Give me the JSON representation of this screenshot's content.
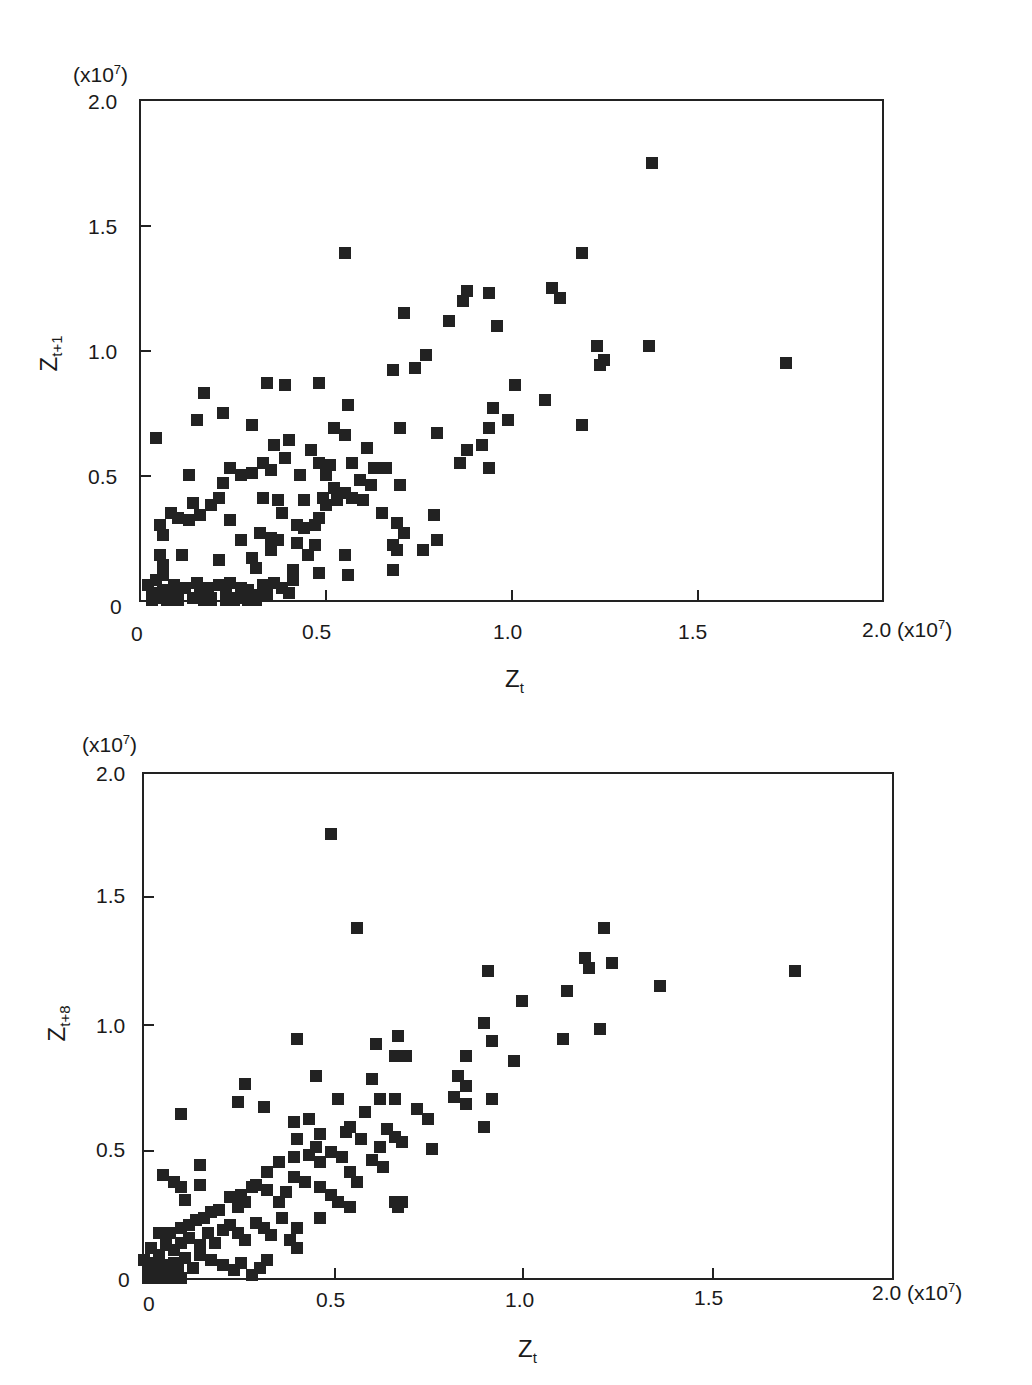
{
  "chart_data": [
    {
      "type": "scatter",
      "title": "",
      "xlabel": "Z_t",
      "ylabel": "Z_t+1",
      "x_unit": "(x10^7)",
      "y_unit": "(x10^7)",
      "xlim": [
        0,
        2.0
      ],
      "ylim": [
        0,
        2.0
      ],
      "xticks": [
        "0",
        "0.5",
        "1.0",
        "1.5",
        "2.0"
      ],
      "yticks": [
        "0",
        "0.5",
        "1.0",
        "1.5",
        "2.0"
      ],
      "grid": false,
      "points": [
        [
          1.38,
          1.75
        ],
        [
          0.55,
          1.39
        ],
        [
          1.19,
          1.39
        ],
        [
          0.88,
          1.24
        ],
        [
          0.94,
          1.23
        ],
        [
          1.11,
          1.25
        ],
        [
          0.87,
          1.2
        ],
        [
          1.13,
          1.21
        ],
        [
          0.71,
          1.15
        ],
        [
          0.83,
          1.12
        ],
        [
          0.96,
          1.1
        ],
        [
          1.23,
          1.02
        ],
        [
          1.37,
          1.02
        ],
        [
          1.74,
          0.95
        ],
        [
          1.24,
          0.94
        ],
        [
          1.25,
          0.96
        ],
        [
          0.68,
          0.92
        ],
        [
          0.74,
          0.93
        ],
        [
          0.77,
          0.98
        ],
        [
          1.01,
          0.86
        ],
        [
          0.17,
          0.83
        ],
        [
          0.34,
          0.87
        ],
        [
          0.39,
          0.86
        ],
        [
          0.48,
          0.87
        ],
        [
          0.56,
          0.78
        ],
        [
          0.22,
          0.75
        ],
        [
          0.15,
          0.72
        ],
        [
          1.09,
          0.8
        ],
        [
          0.95,
          0.77
        ],
        [
          0.99,
          0.72
        ],
        [
          1.19,
          0.7
        ],
        [
          0.04,
          0.65
        ],
        [
          0.3,
          0.7
        ],
        [
          0.7,
          0.69
        ],
        [
          0.8,
          0.67
        ],
        [
          0.52,
          0.69
        ],
        [
          0.55,
          0.66
        ],
        [
          0.92,
          0.62
        ],
        [
          0.94,
          0.69
        ],
        [
          0.88,
          0.6
        ],
        [
          0.86,
          0.55
        ],
        [
          0.94,
          0.53
        ],
        [
          0.36,
          0.62
        ],
        [
          0.4,
          0.64
        ],
        [
          0.46,
          0.6
        ],
        [
          0.33,
          0.55
        ],
        [
          0.35,
          0.52
        ],
        [
          0.39,
          0.57
        ],
        [
          0.48,
          0.55
        ],
        [
          0.51,
          0.54
        ],
        [
          0.57,
          0.55
        ],
        [
          0.61,
          0.61
        ],
        [
          0.63,
          0.53
        ],
        [
          0.66,
          0.53
        ],
        [
          0.24,
          0.53
        ],
        [
          0.27,
          0.5
        ],
        [
          0.3,
          0.51
        ],
        [
          0.13,
          0.5
        ],
        [
          0.43,
          0.5
        ],
        [
          0.5,
          0.5
        ],
        [
          0.55,
          0.43
        ],
        [
          0.59,
          0.48
        ],
        [
          0.62,
          0.46
        ],
        [
          0.7,
          0.46
        ],
        [
          0.08,
          0.35
        ],
        [
          0.1,
          0.33
        ],
        [
          0.13,
          0.32
        ],
        [
          0.16,
          0.34
        ],
        [
          0.19,
          0.38
        ],
        [
          0.21,
          0.41
        ],
        [
          0.22,
          0.47
        ],
        [
          0.33,
          0.41
        ],
        [
          0.37,
          0.4
        ],
        [
          0.38,
          0.35
        ],
        [
          0.44,
          0.4
        ],
        [
          0.49,
          0.41
        ],
        [
          0.52,
          0.45
        ],
        [
          0.57,
          0.41
        ],
        [
          0.6,
          0.4
        ],
        [
          0.65,
          0.35
        ],
        [
          0.69,
          0.31
        ],
        [
          0.71,
          0.27
        ],
        [
          0.79,
          0.34
        ],
        [
          0.05,
          0.3
        ],
        [
          0.06,
          0.26
        ],
        [
          0.14,
          0.39
        ],
        [
          0.24,
          0.32
        ],
        [
          0.27,
          0.24
        ],
        [
          0.32,
          0.27
        ],
        [
          0.35,
          0.25
        ],
        [
          0.37,
          0.24
        ],
        [
          0.42,
          0.3
        ],
        [
          0.44,
          0.29
        ],
        [
          0.47,
          0.3
        ],
        [
          0.48,
          0.33
        ],
        [
          0.5,
          0.38
        ],
        [
          0.53,
          0.4
        ],
        [
          0.68,
          0.22
        ],
        [
          0.69,
          0.2
        ],
        [
          0.76,
          0.2
        ],
        [
          0.8,
          0.24
        ],
        [
          0.05,
          0.18
        ],
        [
          0.06,
          0.14
        ],
        [
          0.06,
          0.1
        ],
        [
          0.11,
          0.18
        ],
        [
          0.21,
          0.16
        ],
        [
          0.3,
          0.17
        ],
        [
          0.31,
          0.13
        ],
        [
          0.35,
          0.2
        ],
        [
          0.42,
          0.23
        ],
        [
          0.45,
          0.18
        ],
        [
          0.47,
          0.22
        ],
        [
          0.55,
          0.18
        ],
        [
          0.56,
          0.1
        ],
        [
          0.48,
          0.11
        ],
        [
          0.41,
          0.12
        ],
        [
          0.68,
          0.12
        ],
        [
          0.02,
          0.06
        ],
        [
          0.03,
          0.03
        ],
        [
          0.04,
          0.08
        ],
        [
          0.05,
          0.01
        ],
        [
          0.06,
          0.04
        ],
        [
          0.08,
          0.02
        ],
        [
          0.09,
          0.06
        ],
        [
          0.1,
          0.03
        ],
        [
          0.12,
          0.05
        ],
        [
          0.14,
          0.01
        ],
        [
          0.15,
          0.07
        ],
        [
          0.16,
          0.03
        ],
        [
          0.18,
          0.05
        ],
        [
          0.19,
          0.01
        ],
        [
          0.21,
          0.06
        ],
        [
          0.23,
          0.03
        ],
        [
          0.24,
          0.07
        ],
        [
          0.26,
          0.01
        ],
        [
          0.27,
          0.05
        ],
        [
          0.29,
          0.04
        ],
        [
          0.31,
          0.02
        ],
        [
          0.33,
          0.06
        ],
        [
          0.34,
          0.02
        ],
        [
          0.36,
          0.07
        ],
        [
          0.38,
          0.05
        ],
        [
          0.4,
          0.03
        ],
        [
          0.41,
          0.08
        ],
        [
          0.03,
          0.0
        ],
        [
          0.07,
          0.0
        ],
        [
          0.1,
          0.0
        ],
        [
          0.17,
          0.0
        ],
        [
          0.19,
          0.0
        ],
        [
          0.23,
          0.0
        ],
        [
          0.25,
          0.0
        ],
        [
          0.29,
          0.0
        ],
        [
          0.31,
          0.0
        ]
      ]
    },
    {
      "type": "scatter",
      "title": "",
      "xlabel": "Z_t",
      "ylabel": "Z_t+8",
      "x_unit": "(x10^7)",
      "y_unit": "(x10^7)",
      "xlim": [
        0,
        2.0
      ],
      "ylim": [
        0,
        2.0
      ],
      "xticks": [
        "0",
        "0.5",
        "1.0",
        "1.5",
        "2.0"
      ],
      "yticks": [
        "0",
        "0.5",
        "1.0",
        "1.5",
        "2.0"
      ],
      "grid": false,
      "points": [
        [
          0.5,
          1.76
        ],
        [
          0.57,
          1.39
        ],
        [
          1.23,
          1.39
        ],
        [
          1.18,
          1.27
        ],
        [
          1.19,
          1.23
        ],
        [
          1.25,
          1.25
        ],
        [
          1.74,
          1.22
        ],
        [
          0.92,
          1.22
        ],
        [
          1.13,
          1.14
        ],
        [
          1.01,
          1.1
        ],
        [
          1.38,
          1.16
        ],
        [
          0.41,
          0.95
        ],
        [
          0.62,
          0.93
        ],
        [
          0.68,
          0.96
        ],
        [
          0.91,
          1.01
        ],
        [
          0.93,
          0.94
        ],
        [
          1.12,
          0.95
        ],
        [
          1.22,
          0.99
        ],
        [
          0.99,
          0.86
        ],
        [
          0.67,
          0.88
        ],
        [
          0.7,
          0.88
        ],
        [
          0.86,
          0.88
        ],
        [
          0.27,
          0.77
        ],
        [
          0.46,
          0.8
        ],
        [
          0.61,
          0.79
        ],
        [
          0.63,
          0.71
        ],
        [
          0.67,
          0.71
        ],
        [
          0.84,
          0.8
        ],
        [
          0.86,
          0.76
        ],
        [
          0.83,
          0.72
        ],
        [
          0.86,
          0.69
        ],
        [
          0.93,
          0.71
        ],
        [
          0.91,
          0.6
        ],
        [
          0.1,
          0.65
        ],
        [
          0.25,
          0.7
        ],
        [
          0.32,
          0.68
        ],
        [
          0.4,
          0.62
        ],
        [
          0.44,
          0.63
        ],
        [
          0.52,
          0.71
        ],
        [
          0.59,
          0.66
        ],
        [
          0.65,
          0.59
        ],
        [
          0.73,
          0.67
        ],
        [
          0.76,
          0.63
        ],
        [
          0.77,
          0.51
        ],
        [
          0.41,
          0.55
        ],
        [
          0.47,
          0.57
        ],
        [
          0.54,
          0.58
        ],
        [
          0.55,
          0.6
        ],
        [
          0.58,
          0.55
        ],
        [
          0.63,
          0.52
        ],
        [
          0.67,
          0.56
        ],
        [
          0.69,
          0.54
        ],
        [
          0.61,
          0.47
        ],
        [
          0.64,
          0.44
        ],
        [
          0.05,
          0.41
        ],
        [
          0.08,
          0.38
        ],
        [
          0.1,
          0.36
        ],
        [
          0.11,
          0.31
        ],
        [
          0.15,
          0.45
        ],
        [
          0.15,
          0.37
        ],
        [
          0.26,
          0.33
        ],
        [
          0.3,
          0.37
        ],
        [
          0.33,
          0.42
        ],
        [
          0.36,
          0.46
        ],
        [
          0.4,
          0.48
        ],
        [
          0.44,
          0.49
        ],
        [
          0.46,
          0.52
        ],
        [
          0.47,
          0.46
        ],
        [
          0.5,
          0.5
        ],
        [
          0.53,
          0.48
        ],
        [
          0.55,
          0.42
        ],
        [
          0.57,
          0.38
        ],
        [
          0.04,
          0.18
        ],
        [
          0.07,
          0.18
        ],
        [
          0.1,
          0.2
        ],
        [
          0.12,
          0.21
        ],
        [
          0.14,
          0.23
        ],
        [
          0.16,
          0.24
        ],
        [
          0.18,
          0.26
        ],
        [
          0.2,
          0.27
        ],
        [
          0.23,
          0.32
        ],
        [
          0.25,
          0.28
        ],
        [
          0.27,
          0.3
        ],
        [
          0.29,
          0.36
        ],
        [
          0.33,
          0.35
        ],
        [
          0.36,
          0.3
        ],
        [
          0.38,
          0.34
        ],
        [
          0.4,
          0.4
        ],
        [
          0.43,
          0.38
        ],
        [
          0.47,
          0.36
        ],
        [
          0.5,
          0.33
        ],
        [
          0.52,
          0.3
        ],
        [
          0.55,
          0.28
        ],
        [
          0.67,
          0.3
        ],
        [
          0.69,
          0.3
        ],
        [
          0.68,
          0.28
        ],
        [
          0.47,
          0.24
        ],
        [
          0.41,
          0.2
        ],
        [
          0.02,
          0.12
        ],
        [
          0.04,
          0.09
        ],
        [
          0.06,
          0.13
        ],
        [
          0.08,
          0.11
        ],
        [
          0.1,
          0.14
        ],
        [
          0.12,
          0.16
        ],
        [
          0.15,
          0.13
        ],
        [
          0.17,
          0.18
        ],
        [
          0.19,
          0.14
        ],
        [
          0.21,
          0.19
        ],
        [
          0.23,
          0.21
        ],
        [
          0.25,
          0.18
        ],
        [
          0.27,
          0.15
        ],
        [
          0.3,
          0.22
        ],
        [
          0.32,
          0.2
        ],
        [
          0.34,
          0.17
        ],
        [
          0.37,
          0.24
        ],
        [
          0.39,
          0.15
        ],
        [
          0.41,
          0.12
        ],
        [
          0.33,
          0.07
        ],
        [
          0.0,
          0.07
        ],
        [
          0.01,
          0.04
        ],
        [
          0.02,
          0.02
        ],
        [
          0.03,
          0.06
        ],
        [
          0.04,
          0.01
        ],
        [
          0.05,
          0.05
        ],
        [
          0.06,
          0.02
        ],
        [
          0.08,
          0.06
        ],
        [
          0.09,
          0.03
        ],
        [
          0.11,
          0.08
        ],
        [
          0.13,
          0.04
        ],
        [
          0.15,
          0.09
        ],
        [
          0.18,
          0.07
        ],
        [
          0.21,
          0.05
        ],
        [
          0.24,
          0.03
        ],
        [
          0.26,
          0.06
        ],
        [
          0.29,
          0.01
        ],
        [
          0.31,
          0.04
        ],
        [
          0.01,
          0.0
        ],
        [
          0.03,
          0.0
        ],
        [
          0.05,
          0.0
        ],
        [
          0.08,
          0.0
        ],
        [
          0.1,
          0.0
        ]
      ]
    }
  ],
  "plots": [
    {
      "unit_label": "(x10",
      "unit_exp": "7",
      "unit_close": ")",
      "y_ticks": [
        "2.0",
        "1.5",
        "1.0",
        "0.5",
        "0"
      ],
      "x_ticks": [
        "0",
        "0.5",
        "1.0",
        "1.5",
        "2.0"
      ],
      "x_unit": "(x10",
      "x_unit_exp": "7",
      "x_unit_close": ")",
      "x_title": "Z",
      "x_title_sub": "t",
      "y_title": "Z",
      "y_title_sub": "t+1"
    },
    {
      "unit_label": "(x10",
      "unit_exp": "7",
      "unit_close": ")",
      "y_ticks": [
        "2.0",
        "1.5",
        "1.0",
        "0.5",
        "0"
      ],
      "x_ticks": [
        "0",
        "0.5",
        "1.0",
        "1.5",
        "2.0"
      ],
      "x_unit": "(x10",
      "x_unit_exp": "7",
      "x_unit_close": ")",
      "x_title": "Z",
      "x_title_sub": "t",
      "y_title": "Z",
      "y_title_sub": "t+8"
    }
  ]
}
